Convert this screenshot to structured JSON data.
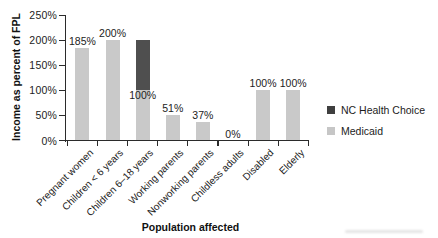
{
  "chart_data": {
    "type": "bar",
    "stacked": true,
    "title": "",
    "xlabel": "Population affected",
    "ylabel": "Income as percent of FPL",
    "ylim": [
      0,
      250
    ],
    "grid": false,
    "yticks": [
      {
        "value": 0,
        "label": "0%"
      },
      {
        "value": 50,
        "label": "50%"
      },
      {
        "value": 100,
        "label": "100%"
      },
      {
        "value": 150,
        "label": "150%"
      },
      {
        "value": 200,
        "label": "200%"
      },
      {
        "value": 250,
        "label": "250%"
      }
    ],
    "categories": [
      "Pregnant women",
      "Children < 6 years",
      "Children 6–18 years",
      "Working parents",
      "Nonworking parents",
      "Childless adults",
      "Disabled",
      "Elderly"
    ],
    "series": [
      {
        "name": "Medicaid",
        "color": "#c9c9c9",
        "values": [
          185,
          200,
          100,
          51,
          37,
          0,
          100,
          100
        ]
      },
      {
        "name": "NC Health Choice",
        "color": "#4f4f4f",
        "values": [
          0,
          0,
          100,
          0,
          0,
          0,
          0,
          0
        ]
      }
    ],
    "bar_labels": [
      "185%",
      "200%",
      "100%",
      "51%",
      "37%",
      "0%",
      "100%",
      "100%"
    ],
    "legend": {
      "position": "right",
      "items": [
        {
          "label": "NC Health Choice",
          "color": "#3f3f3f"
        },
        {
          "label": "Medicaid",
          "color": "#c6c6c6"
        }
      ]
    }
  },
  "colors": {
    "axis": "#2b2b2b",
    "text": "#1c1c1c",
    "background": "#ffffff"
  }
}
